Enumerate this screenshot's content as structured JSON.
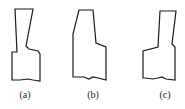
{
  "figure": {
    "stroke_color": "#1a1a1a",
    "shapes": [
      {
        "id": "a",
        "label": "(a)",
        "label_x": 25,
        "points": "15,9 33,9 26,46 29,49 38,51 40,54 40,81 33,80 28,79 20,80 12,80 12,52 17,52 15,9"
      },
      {
        "id": "b",
        "label": "(b)",
        "label_x": 93,
        "points": "79,10 93,10 96,43 106,47 106,80 98,78 93,77 89,79 84,77 73,77 73,34 79,10"
      },
      {
        "id": "c",
        "label": "(c)",
        "label_x": 165,
        "points": "160,11 176,11 172,44 175,47 175,80 166,79 162,77 158,78 153,79 145,78 143,78 143,51 158,47 160,11"
      }
    ]
  }
}
